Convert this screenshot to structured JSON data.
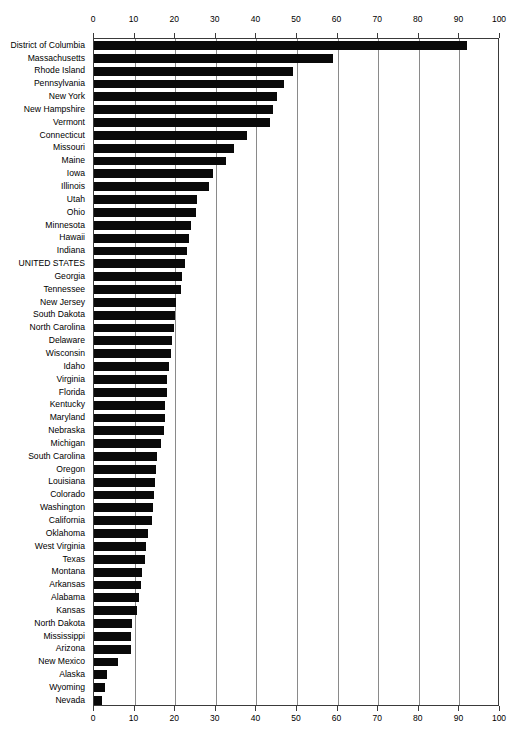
{
  "chart_data": {
    "type": "bar",
    "orientation": "horizontal",
    "title": "",
    "xlabel": "",
    "ylabel": "",
    "xlim": [
      0,
      100
    ],
    "xticks": [
      0,
      10,
      20,
      30,
      40,
      50,
      60,
      70,
      80,
      90,
      100
    ],
    "grid": true,
    "grid_axis": "x",
    "legend": null,
    "bar_color": "#090909",
    "axis_color": "#3a3a3a",
    "gridline_color": "#8a8a8a",
    "background": "#ffffff",
    "highlight_category": "UNITED STATES",
    "categories": [
      "District of Columbia",
      "Massachusetts",
      "Rhode Island",
      "Pennsylvania",
      "New York",
      "New Hampshire",
      "Vermont",
      "Connecticut",
      "Missouri",
      "Maine",
      "Iowa",
      "Illinois",
      "Utah",
      "Ohio",
      "Minnesota",
      "Hawaii",
      "Indiana",
      "UNITED STATES",
      "Georgia",
      "Tennessee",
      "New Jersey",
      "South Dakota",
      "North Carolina",
      "Delaware",
      "Wisconsin",
      "Idaho",
      "Virginia",
      "Florida",
      "Kentucky",
      "Maryland",
      "Nebraska",
      "Michigan",
      "South Carolina",
      "Oregon",
      "Louisiana",
      "Colorado",
      "Washington",
      "California",
      "Oklahoma",
      "West Virginia",
      "Texas",
      "Montana",
      "Arkansas",
      "Alabama",
      "Kansas",
      "North Dakota",
      "Mississippi",
      "Arizona",
      "New Mexico",
      "Alaska",
      "Wyoming",
      "Nevada"
    ],
    "values": [
      91.8,
      58.9,
      49.0,
      46.8,
      45.0,
      44.0,
      43.4,
      37.8,
      34.5,
      32.5,
      29.4,
      28.4,
      25.3,
      25.0,
      24.0,
      23.4,
      23.0,
      22.5,
      21.6,
      21.4,
      20.2,
      19.9,
      19.6,
      19.2,
      19.0,
      18.4,
      18.0,
      17.9,
      17.6,
      17.4,
      17.2,
      16.6,
      15.6,
      15.2,
      15.0,
      14.8,
      14.6,
      14.3,
      13.4,
      12.8,
      12.5,
      11.8,
      11.5,
      11.0,
      10.5,
      9.4,
      9.2,
      9.0,
      5.8,
      3.3,
      2.7,
      2.0
    ]
  }
}
